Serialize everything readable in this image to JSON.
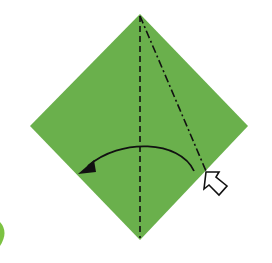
{
  "diagram": {
    "type": "origami-step",
    "paper_color": "#6ab04c",
    "edge_sliver_color": "#7cc242",
    "line_color": "#111111",
    "arrow_fill": "#ffffff",
    "shape": "square-diamond",
    "vertices": {
      "top": [
        140,
        14
      ],
      "right": [
        248,
        126
      ],
      "bottom": [
        140,
        240
      ],
      "left": [
        30,
        126
      ]
    },
    "folds": [
      {
        "kind": "valley-fold",
        "style": "dashed",
        "from": [
          140,
          14
        ],
        "to": [
          140,
          240
        ]
      },
      {
        "kind": "mountain-fold",
        "style": "dash-dot",
        "from": [
          140,
          14
        ],
        "to": [
          206,
          172
        ]
      }
    ],
    "arrows": [
      {
        "kind": "fold-direction-arrow",
        "description": "curved arrow fold to left"
      },
      {
        "kind": "push-arrow",
        "description": "hollow inside-reverse push arrow"
      }
    ],
    "label": "Origami fold step: push in along the right crease and fold to the left"
  }
}
